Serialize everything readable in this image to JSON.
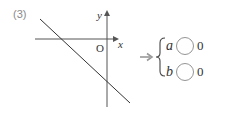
{
  "problem": {
    "number": "(3)"
  },
  "graph": {
    "x_axis_label": "x",
    "y_axis_label": "y",
    "origin_label": "O",
    "line_description": "decreasing line with negative slope and negative y-intercept"
  },
  "answer": {
    "arrow": "→",
    "rows": [
      {
        "variable": "a",
        "comparison": "0"
      },
      {
        "variable": "b",
        "comparison": "0"
      }
    ]
  },
  "colors": {
    "axis": "#555555",
    "line": "#333333",
    "circle": "#888888",
    "arrow": "#999999",
    "number": "#8a8a8a"
  }
}
